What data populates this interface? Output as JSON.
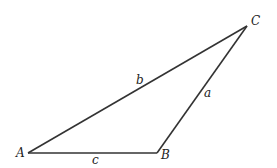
{
  "diagram": {
    "type": "triangle",
    "stroke_color": "#333333",
    "vertices": [
      {
        "id": "A",
        "label": "A",
        "x": 28,
        "y": 153,
        "label_x": 16,
        "label_y": 157
      },
      {
        "id": "B",
        "label": "B",
        "x": 157,
        "y": 153,
        "label_x": 161,
        "label_y": 159
      },
      {
        "id": "C",
        "label": "C",
        "x": 247,
        "y": 26,
        "label_x": 251,
        "label_y": 25
      }
    ],
    "sides": [
      {
        "id": "a",
        "label": "a",
        "from": "B",
        "to": "C",
        "label_x": 204,
        "label_y": 97
      },
      {
        "id": "b",
        "label": "b",
        "from": "A",
        "to": "C",
        "label_x": 136,
        "label_y": 84
      },
      {
        "id": "c",
        "label": "c",
        "from": "A",
        "to": "B",
        "label_x": 92,
        "label_y": 164
      }
    ]
  }
}
